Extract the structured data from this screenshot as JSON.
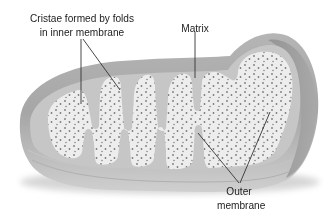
{
  "diagram": {
    "colors": {
      "background": "#ffffff",
      "outer_membrane_top": "#bdbdbd",
      "outer_membrane_side": "#9e9e9e",
      "intermembrane": "#c8c8c8",
      "matrix": "#ececec",
      "matrix_dots": "#7a7a7a",
      "leader_lines": "#333333",
      "label_text": "#222222"
    }
  },
  "labels": {
    "cristae": {
      "line1": "Cristae formed by folds",
      "line2": "in inner membrane"
    },
    "matrix": "Matrix",
    "outer_membrane": {
      "line1": "Outer",
      "line2": "membrane"
    }
  }
}
